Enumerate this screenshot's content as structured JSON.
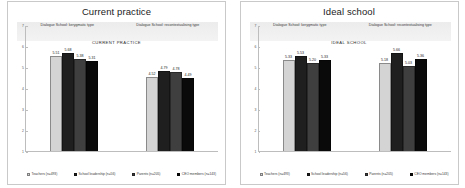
{
  "figure": {
    "background": "#ffffff",
    "series_colors": [
      "#d4d4d4",
      "#1f1f1f",
      "#3f3f3f",
      "#0a0a0a"
    ]
  },
  "panels": [
    {
      "title": "Current practice",
      "inner_title": "CURRENT PRACTICE",
      "subheaders": [
        "Dialogue School: kerygmatic type",
        "Dialogue School: recontextualising type"
      ],
      "chart_data": {
        "type": "bar",
        "title": "CURRENT PRACTICE",
        "xlabel": "",
        "ylabel": "",
        "ylim": [
          1,
          7
        ],
        "yticks": [
          7,
          6,
          5,
          4,
          3,
          2,
          1
        ],
        "grid": false,
        "legend_position": "bottom",
        "categories": [
          "Dialogue School: kerygmatic type",
          "Dialogue School: recontextualising type"
        ],
        "series": [
          {
            "name": "Teachers (n=493)",
            "values": [
              5.51,
              4.52
            ]
          },
          {
            "name": "School leadership (n=56)",
            "values": [
              5.68,
              4.79
            ]
          },
          {
            "name": "Parents (n=205)",
            "values": [
              5.38,
              4.78
            ]
          },
          {
            "name": "CEO members (n=143)",
            "values": [
              5.31,
              4.49
            ]
          }
        ]
      }
    },
    {
      "title": "Ideal school",
      "inner_title": "IDEAL SCHOOL",
      "subheaders": [
        "Dialogue School: kerygmatic type",
        "Dialogue School: recontextualising type"
      ],
      "chart_data": {
        "type": "bar",
        "title": "IDEAL SCHOOL",
        "xlabel": "",
        "ylabel": "",
        "ylim": [
          1,
          7
        ],
        "yticks": [
          7,
          6,
          5,
          4,
          3,
          2,
          1
        ],
        "grid": false,
        "legend_position": "bottom",
        "categories": [
          "Dialogue School: kerygmatic type",
          "Dialogue School: recontextualising type"
        ],
        "series": [
          {
            "name": "Teachers (n=493)",
            "values": [
              5.33,
              5.18
            ]
          },
          {
            "name": "School leadership (n=56)",
            "values": [
              5.53,
              5.66
            ]
          },
          {
            "name": "Parents (n=205)",
            "values": [
              5.2,
              5.03
            ]
          },
          {
            "name": "CEO members (n=143)",
            "values": [
              5.33,
              5.36
            ]
          }
        ]
      }
    }
  ],
  "legend": {
    "items": [
      "Teachers (n=493)",
      "School leadership (n=56)",
      "Parents (n=205)",
      "CEO members (n=143)"
    ]
  }
}
